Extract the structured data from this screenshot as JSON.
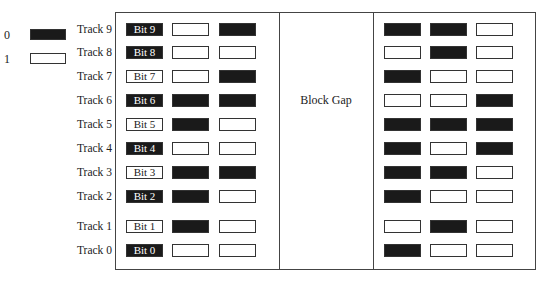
{
  "legend": {
    "items": [
      {
        "label": "0",
        "fill": "#1a1a1a"
      },
      {
        "label": "1",
        "fill": "#ffffff"
      }
    ]
  },
  "gap_label": "Block Gap",
  "tracks": [
    {
      "label": "Track 9",
      "bit_label": "Bit  9",
      "left": [
        0,
        1,
        0
      ],
      "right": [
        0,
        0,
        1
      ]
    },
    {
      "label": "Track 8",
      "bit_label": "Bit 8",
      "left": [
        0,
        1,
        1
      ],
      "right": [
        1,
        0,
        1
      ]
    },
    {
      "label": "Track 7",
      "bit_label": "Bit 7",
      "left": [
        1,
        1,
        0
      ],
      "right": [
        0,
        1,
        1
      ]
    },
    {
      "label": "Track 6",
      "bit_label": "Bit 6",
      "left": [
        0,
        0,
        0
      ],
      "right": [
        1,
        1,
        0
      ]
    },
    {
      "label": "Track 5",
      "bit_label": "Bit 5",
      "left": [
        1,
        0,
        1
      ],
      "right": [
        0,
        0,
        0
      ]
    },
    {
      "label": "Track 4",
      "bit_label": "Bit 4",
      "left": [
        0,
        1,
        1
      ],
      "right": [
        0,
        1,
        0
      ]
    },
    {
      "label": "Track 3",
      "bit_label": "Bit 3",
      "left": [
        1,
        0,
        0
      ],
      "right": [
        0,
        0,
        1
      ]
    },
    {
      "label": "Track 2",
      "bit_label": "Bit 2",
      "left": [
        0,
        0,
        1
      ],
      "right": [
        0,
        1,
        1
      ]
    },
    {
      "label": "Track 1",
      "bit_label": "Bit 1",
      "left": [
        1,
        0,
        1
      ],
      "right": [
        1,
        0,
        1
      ]
    },
    {
      "label": "Track 0",
      "bit_label": "Bit 0",
      "left": [
        0,
        1,
        1
      ],
      "right": [
        0,
        1,
        1
      ]
    }
  ],
  "colors": {
    "zero": "#1a1a1a",
    "one": "#ffffff",
    "border": "#333333"
  }
}
